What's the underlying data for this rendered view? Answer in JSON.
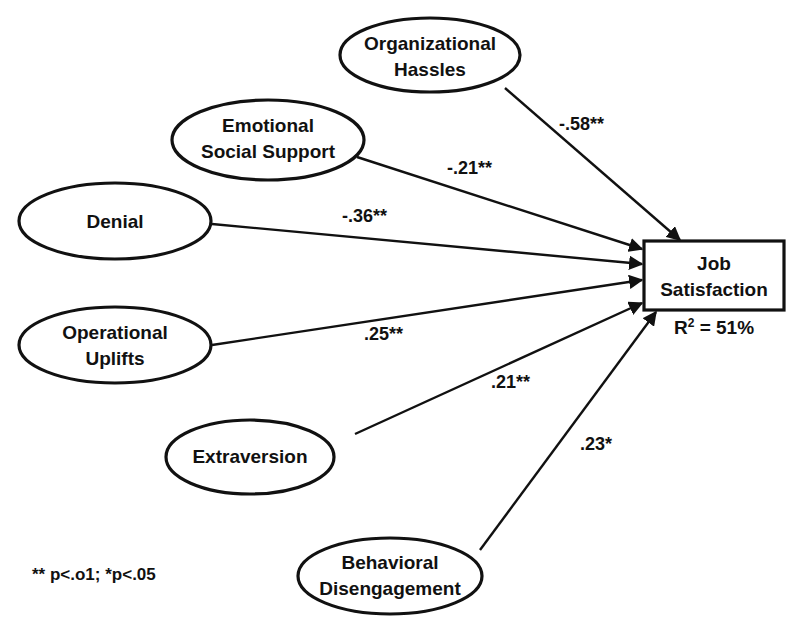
{
  "diagram": {
    "type": "path-diagram",
    "outcome": {
      "id": "job_satisfaction",
      "lines": [
        "Job",
        "Satisfaction"
      ],
      "r_squared_prefix": "R",
      "r_squared_sup": "2",
      "r_squared_suffix": " = 51%"
    },
    "predictors": [
      {
        "id": "organizational_hassles",
        "lines": [
          "Organizational",
          "Hassles"
        ],
        "coefficient": "-.58**"
      },
      {
        "id": "emotional_social_support",
        "lines": [
          "Emotional",
          "Social Support"
        ],
        "coefficient": "-.21**"
      },
      {
        "id": "denial",
        "lines": [
          "Denial"
        ],
        "coefficient": "-.36**"
      },
      {
        "id": "operational_uplifts",
        "lines": [
          "Operational",
          "Uplifts"
        ],
        "coefficient": ".25**"
      },
      {
        "id": "extraversion",
        "lines": [
          "Extraversion"
        ],
        "coefficient": ".21**"
      },
      {
        "id": "behavioral_disengagement",
        "lines": [
          "Behavioral",
          "Disengagement"
        ],
        "coefficient": ".23*"
      }
    ],
    "footnote": "** p<.o1; *p<.05",
    "colors": {
      "stroke": "#111111",
      "background": "#ffffff"
    }
  }
}
